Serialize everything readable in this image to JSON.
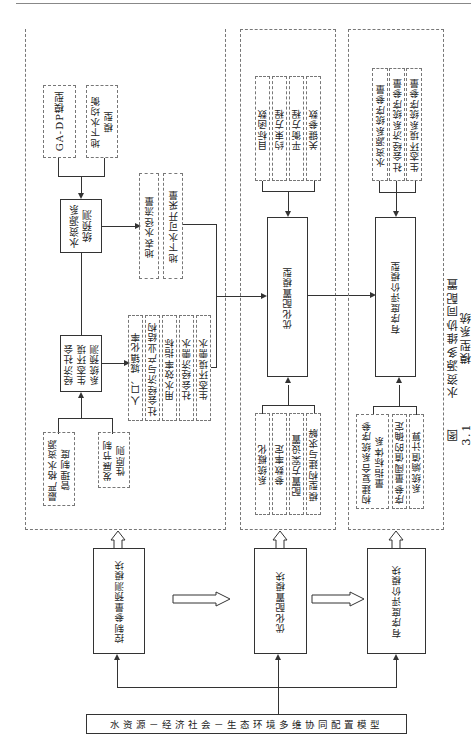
{
  "figure": {
    "caption_number": "图 3.1",
    "caption_title": "水资源多维协同配置模型系统"
  },
  "root": {
    "label": "水资源－经济社会－生态环境多维协同配置模型"
  },
  "modules": [
    {
      "label": "控制参量预测模块"
    },
    {
      "label": "优化配置模块"
    },
    {
      "label": "有序度评价模块"
    }
  ],
  "panel_prediction": {
    "upper_inputs": [
      "GA-DP模型",
      "地下水均衡\n模型"
    ],
    "water_forecast": "水资源系\n统预测",
    "water_outputs": [
      "地表水径流量",
      "地下水可开采量"
    ],
    "socio_forecast": "经济社会\n生态环境\n系统预测",
    "socio_outputs": [
      "人口、城镇化率",
      "社会经济与产业结构",
      "用水效率指标",
      "社会经济需水",
      "生态环境需水"
    ],
    "lower_inputs": [
      "最严格水资源\n管理制度",
      "发展节制\n性原则"
    ]
  },
  "panel_optimization": {
    "model": "优化配置模型",
    "upper_inputs": [
      "目标函数",
      "约束方程",
      "平衡方程",
      "关键参数"
    ],
    "lower_inputs": [
      "系统概化",
      "参数率定",
      "配置方案设置",
      "模型构建与求解"
    ]
  },
  "panel_evaluation": {
    "model": "有序度评价模型",
    "upper_inputs": [
      "水资源系统序参量",
      "社会经济系统序参量",
      "生态环境系统序参量"
    ],
    "lower_inputs": [
      "构建复合系统序参\n量指标体系",
      "序参量阈值的确定",
      "系统熵值计算"
    ]
  },
  "colors": {
    "line": "#333333",
    "dashed": "#777777",
    "background": "#ffffff"
  }
}
